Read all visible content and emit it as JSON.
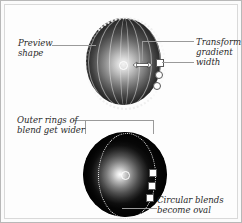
{
  "figure": {
    "background_color": "#fdfdfd",
    "border_color": "#b8b8b8"
  },
  "callouts": [
    {
      "name": "preview-shape",
      "lines": [
        "Preview",
        "shape"
      ],
      "position": "top-left",
      "leader": "horizontal-line-to-top-sphere"
    },
    {
      "name": "transform-gradient-width",
      "lines": [
        "Transform",
        "gradient",
        "width"
      ],
      "position": "top-right",
      "leader": "bracket-to-arrow-and-handle"
    },
    {
      "name": "outer-rings-of-blend-get-wider",
      "lines": [
        "Outer rings of",
        "blend get wider"
      ],
      "position": "middle-left",
      "leader": "bracket-over-bottom-sphere"
    },
    {
      "name": "circular-blends-become-oval",
      "lines": [
        "Circular blends",
        "become oval"
      ],
      "position": "bottom-right",
      "leader": "horizontal-line-to-bottom-sphere"
    }
  ],
  "shapes": {
    "top_sphere": {
      "name": "preview-sphere-circular-blend",
      "description": "sphere with circular radial blend, evenly spaced meridian petals and dotted preview boundary",
      "center_marker": "center-point-circle",
      "handles": [
        {
          "type": "square",
          "label": "width-handle"
        },
        {
          "type": "circle",
          "label": "blend-handle-1"
        },
        {
          "type": "circle",
          "label": "blend-handle-2"
        }
      ],
      "cursor_icon": "horizontal-resize-arrow",
      "highlight_color": "#f2f2f2",
      "shadow_color": "#3a3a3a"
    },
    "bottom_sphere": {
      "name": "transformed-sphere-oval-blend",
      "description": "sphere after gradient width transform: blend rings widened into ovals with dotted oval boundary",
      "center_marker": "center-point-circle",
      "handles": [
        {
          "type": "square",
          "label": "width-handle"
        },
        {
          "type": "square",
          "label": "blend-handle-1"
        },
        {
          "type": "square",
          "label": "blend-handle-2"
        }
      ],
      "highlight_color": "#ffffff",
      "shadow_color": "#090909"
    }
  },
  "colors": {
    "leader_line": "#9a9a9a",
    "text": "#2a2a2a",
    "handle_fill": "#ffffff",
    "handle_stroke": "#585858"
  }
}
